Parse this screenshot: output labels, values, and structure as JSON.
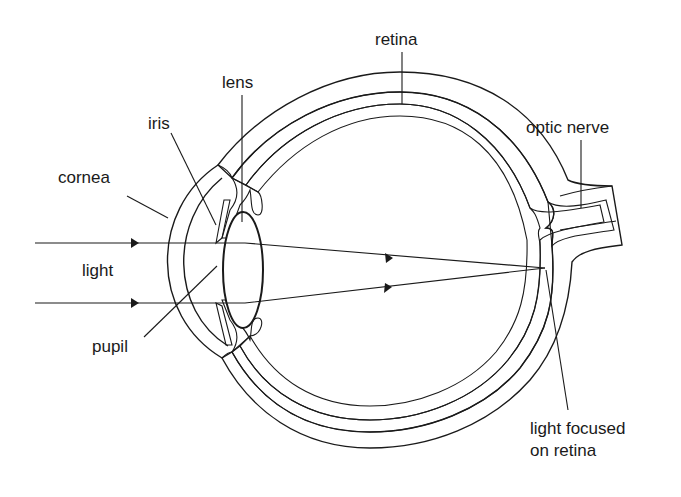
{
  "diagram": {
    "colors": {
      "sclera": "#cfcfcf",
      "choroid_retina": "#b4b4b4",
      "inner_layer": "#8a8a8a",
      "optic_nerve_core": "#7e7e7e",
      "outline": "#1a1a1a",
      "background": "#ffffff"
    },
    "labels": {
      "retina": "retina",
      "lens": "lens",
      "iris": "iris",
      "optic_nerve": "optic nerve",
      "cornea": "cornea",
      "light": "light",
      "pupil": "pupil",
      "light_focused_line1": "light focused",
      "light_focused_line2": "on retina"
    },
    "light_rays": [
      {
        "name": "upper-ray",
        "start_y": 243
      },
      {
        "name": "lower-ray",
        "start_y": 303
      }
    ]
  }
}
